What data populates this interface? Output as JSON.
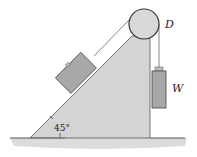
{
  "diagram": {
    "type": "mechanics-free-body",
    "labels": {
      "pulley": "D",
      "hanging_weight": "W",
      "incline_angle": "45°"
    },
    "colors": {
      "wedge_fill": "#d4d4d4",
      "block_fill": "#a8a8a8",
      "pulley_fill": "#d9d9d9",
      "outline": "#444444",
      "ground_shadow": "#cfcfcf"
    }
  }
}
